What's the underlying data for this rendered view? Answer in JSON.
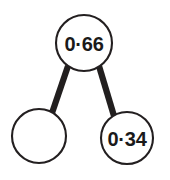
{
  "diagram": {
    "type": "number-bond",
    "background_color": "#ffffff",
    "stroke_color": "#231f20",
    "connector_color": "#221f1f",
    "text_color": "#1a1a1a",
    "nodes": [
      {
        "id": "whole",
        "role": "whole",
        "label": "0·66",
        "value": 0.66,
        "filled": true,
        "cx": 84,
        "cy": 43,
        "r": 28
      },
      {
        "id": "part-left",
        "role": "part",
        "label": "",
        "value": null,
        "filled": false,
        "cx": 39,
        "cy": 136,
        "r": 27
      },
      {
        "id": "part-right",
        "role": "part",
        "label": "0·34",
        "value": 0.34,
        "filled": true,
        "cx": 127,
        "cy": 138,
        "r": 26
      }
    ],
    "connectors": [
      {
        "id": "whole-to-part-left",
        "from": "whole",
        "to": "part-left",
        "x1": 68,
        "y1": 66,
        "x2": 52,
        "y2": 113
      },
      {
        "id": "whole-to-part-right",
        "from": "whole",
        "to": "part-right",
        "x1": 99,
        "y1": 66,
        "x2": 114,
        "y2": 116
      }
    ]
  }
}
